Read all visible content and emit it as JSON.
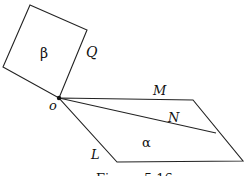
{
  "figure": {
    "planes": [
      {
        "name": "beta",
        "label": "β",
        "side_label": "Q"
      },
      {
        "name": "alpha",
        "label": "α"
      }
    ],
    "point_label": "o",
    "line_labels": {
      "M": "M",
      "N": "N",
      "L": "L"
    },
    "caption": "Figure 5.16",
    "colors": {
      "stroke": "#222222",
      "background": "#ffffff"
    }
  }
}
